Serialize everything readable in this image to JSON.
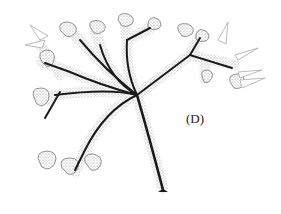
{
  "figure": {
    "label": "(D)",
    "colors": {
      "ink": "#1a1a1a",
      "stipple": "#8a8a8a",
      "background": "#ffffff"
    }
  }
}
